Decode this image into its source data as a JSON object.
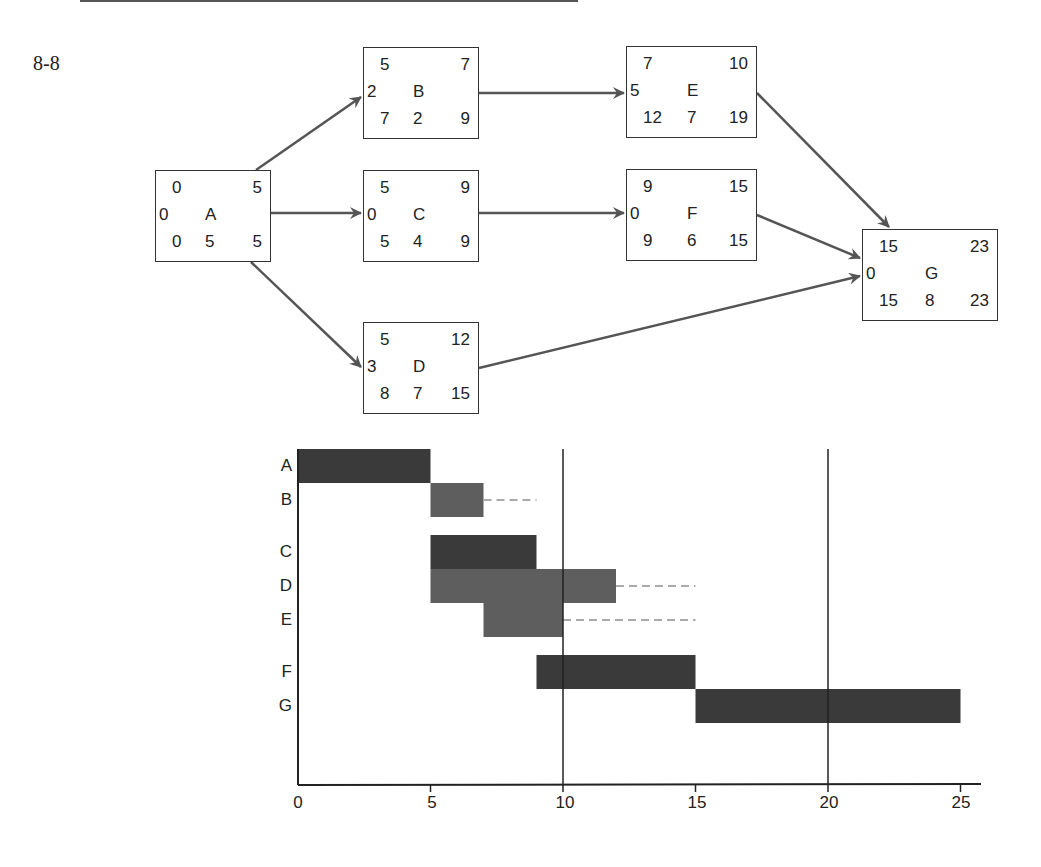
{
  "figure": {
    "label": "8-8"
  },
  "network": {
    "nodes": [
      {
        "id": "A",
        "es": "0",
        "ef": "5",
        "slack": "0",
        "ls": "0",
        "dur": "5",
        "lf": "5",
        "x": 155,
        "y": 170
      },
      {
        "id": "B",
        "es": "5",
        "ef": "7",
        "slack": "2",
        "ls": "7",
        "dur": "2",
        "lf": "9",
        "x": 363,
        "y": 47
      },
      {
        "id": "C",
        "es": "5",
        "ef": "9",
        "slack": "0",
        "ls": "5",
        "dur": "4",
        "lf": "9",
        "x": 363,
        "y": 170
      },
      {
        "id": "D",
        "es": "5",
        "ef": "12",
        "slack": "3",
        "ls": "8",
        "dur": "7",
        "lf": "15",
        "x": 363,
        "y": 322
      },
      {
        "id": "E",
        "es": "7",
        "ef": "10",
        "slack": "5",
        "ls": "12",
        "dur": "7",
        "lf": "19",
        "x": 626,
        "y": 46
      },
      {
        "id": "F",
        "es": "9",
        "ef": "15",
        "slack": "0",
        "ls": "9",
        "dur": "6",
        "lf": "15",
        "x": 626,
        "y": 169
      },
      {
        "id": "G",
        "es": "15",
        "ef": "23",
        "slack": "0",
        "ls": "15",
        "dur": "8",
        "lf": "23",
        "x": 862,
        "y": 229
      }
    ],
    "edges": [
      {
        "from": "A",
        "to": "B"
      },
      {
        "from": "A",
        "to": "C"
      },
      {
        "from": "A",
        "to": "D"
      },
      {
        "from": "B",
        "to": "E"
      },
      {
        "from": "C",
        "to": "F"
      },
      {
        "from": "E",
        "to": "G"
      },
      {
        "from": "F",
        "to": "G"
      },
      {
        "from": "D",
        "to": "G"
      }
    ],
    "legend_note": "Node layout: ES top-left, EF top-right, slack left, activity name center, LS bottom-left, duration bottom-center, LF bottom-right"
  },
  "chart_data": {
    "type": "gantt",
    "title": "",
    "xlabel": "",
    "ylabel": "",
    "xlim": [
      0,
      25
    ],
    "x_ticks": [
      "0",
      "5",
      "10",
      "15",
      "20",
      "25"
    ],
    "reference_lines": [
      10,
      20
    ],
    "tasks": [
      {
        "name": "A",
        "start": 0,
        "end": 5,
        "slack_end": null,
        "shade": "dark"
      },
      {
        "name": "B",
        "start": 5,
        "end": 7,
        "slack_end": 9,
        "shade": "medium"
      },
      {
        "name": "C",
        "start": 5,
        "end": 9,
        "slack_end": null,
        "shade": "dark"
      },
      {
        "name": "D",
        "start": 5,
        "end": 12,
        "slack_end": 15,
        "shade": "medium"
      },
      {
        "name": "E",
        "start": 7,
        "end": 10,
        "slack_end": 15,
        "shade": "medium"
      },
      {
        "name": "F",
        "start": 9,
        "end": 15,
        "slack_end": null,
        "shade": "dark"
      },
      {
        "name": "G",
        "start": 15,
        "end": 25,
        "slack_end": null,
        "shade": "dark"
      }
    ],
    "colors": {
      "dark": "#3a3a3a",
      "medium": "#5e5e5e",
      "slack_dash": "#aaaaaa"
    }
  }
}
